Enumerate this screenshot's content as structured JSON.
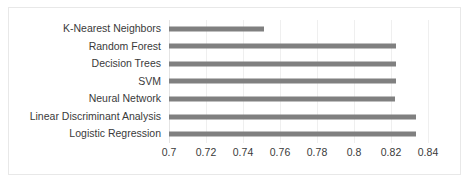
{
  "chart_data": {
    "type": "bar",
    "orientation": "horizontal",
    "title": "",
    "xlabel": "",
    "ylabel": "",
    "categories": [
      "K-Nearest Neighbors",
      "Random Forest",
      "Decision Trees",
      "SVM",
      "Neural Network",
      "Linear Discriminant Analysis",
      "Logistic Regression"
    ],
    "values": [
      0.7515,
      0.8227,
      0.8227,
      0.8227,
      0.822,
      0.8335,
      0.8335
    ],
    "xlim": [
      0.7,
      0.84
    ],
    "xticks": [
      0.7,
      0.72,
      0.74,
      0.76,
      0.78,
      0.8,
      0.82,
      0.84
    ],
    "xtick_labels": [
      "0.7",
      "0.72",
      "0.74",
      "0.76",
      "0.78",
      "0.8",
      "0.82",
      "0.84"
    ],
    "tick_step": 0.02,
    "grid": "vertical",
    "legend": "none",
    "series": [
      {
        "name": "",
        "color": "#808080",
        "values": [
          0.7515,
          0.8227,
          0.8227,
          0.8227,
          0.822,
          0.8335,
          0.8335
        ]
      }
    ]
  },
  "style": {
    "bar_color": "#808080",
    "gridline_color": "#efefef",
    "border_color": "#e8e8e8",
    "text_color": "#3a3a3a",
    "background": "#ffffff"
  }
}
